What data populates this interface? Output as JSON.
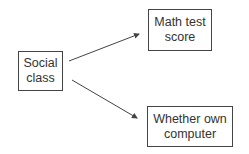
{
  "diagram": {
    "nodes": [
      {
        "id": "social_class",
        "label_lines": [
          "Social",
          "class"
        ]
      },
      {
        "id": "math_score",
        "label_lines": [
          "Math test",
          "score"
        ]
      },
      {
        "id": "own_computer",
        "label_lines": [
          "Whether own",
          "computer"
        ]
      }
    ],
    "edges": [
      {
        "from": "social_class",
        "to": "math_score"
      },
      {
        "from": "social_class",
        "to": "own_computer"
      }
    ],
    "colors": {
      "stroke": "#444444",
      "background": "#ffffff"
    }
  }
}
